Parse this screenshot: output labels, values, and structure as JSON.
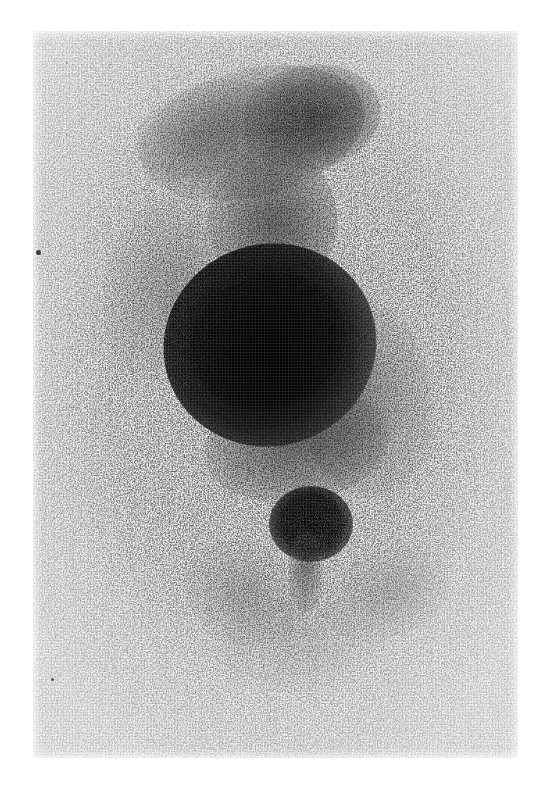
{
  "document": {
    "kind": "nuclear-medicine-scintigram",
    "modality_label": "Gamma camera scintigraphy",
    "view_label": "Anterior whole-body / abdominal view",
    "caption": "",
    "title": ""
  },
  "canvas": {
    "width_px": 546,
    "height_px": 793,
    "page_background_hex": "#ffffff"
  },
  "film_plate": {
    "left_px": 33,
    "top_px": 31,
    "width_px": 485,
    "height_px": 727,
    "background_hex": "#f7f7f6",
    "grain_hex": "#96969b",
    "description": "Grey-white photographic scan film with fine crosshatch weave texture"
  },
  "activity_map": {
    "colormap": "greyscale-inverted",
    "max_density_hex": "#111111",
    "mid_density_hex": "#6b6b6b",
    "low_density_hex": "#c9c9c9",
    "background_density_hex": "#f5f5f4",
    "regions": [
      {
        "name": "upper-diffuse-uptake",
        "anatomy_label": "head / upper thorax diffuse activity",
        "intensity": "low-moderate",
        "center_x_px": 245,
        "center_y_px": 125,
        "radius_x_px": 110,
        "radius_y_px": 58,
        "rotation_deg": -14,
        "peak_opacity": 0.46
      },
      {
        "name": "upper-right-shoulder-uptake",
        "anatomy_label": "right shoulder / upper mediastinum",
        "intensity": "moderate",
        "center_x_px": 305,
        "center_y_px": 118,
        "radius_x_px": 62,
        "radius_y_px": 45,
        "rotation_deg": -10,
        "peak_opacity": 0.62
      },
      {
        "name": "mediastinal-column",
        "anatomy_label": "mediastinal / spinal column activity",
        "intensity": "moderate",
        "center_x_px": 268,
        "center_y_px": 212,
        "radius_x_px": 58,
        "radius_y_px": 66,
        "rotation_deg": 0,
        "peak_opacity": 0.58
      },
      {
        "name": "dominant-hot-mass",
        "anatomy_label": "liver — dominant intense uptake",
        "intensity": "maximum",
        "center_x_px": 265,
        "center_y_px": 340,
        "radius_x_px": 102,
        "radius_y_px": 96,
        "rotation_deg": -18,
        "peak_opacity": 0.99
      },
      {
        "name": "left-lateral-halo",
        "anatomy_label": "left lateral soft-tissue background",
        "intensity": "low",
        "center_x_px": 162,
        "center_y_px": 280,
        "radius_x_px": 58,
        "radius_y_px": 88,
        "rotation_deg": 12,
        "peak_opacity": 0.34
      },
      {
        "name": "right-lateral-halo",
        "anatomy_label": "right lateral soft-tissue background",
        "intensity": "low-moderate",
        "center_x_px": 360,
        "center_y_px": 395,
        "radius_x_px": 62,
        "radius_y_px": 96,
        "rotation_deg": -6,
        "peak_opacity": 0.4
      },
      {
        "name": "sub-hepatic-band",
        "anatomy_label": "sub-hepatic / bowel activity band",
        "intensity": "moderate",
        "center_x_px": 292,
        "center_y_px": 440,
        "radius_x_px": 88,
        "radius_y_px": 52,
        "rotation_deg": -8,
        "peak_opacity": 0.5
      },
      {
        "name": "focal-hot-spot",
        "anatomy_label": "focal round hot spot — bladder / renal pelvis",
        "intensity": "maximum",
        "center_x_px": 304,
        "center_y_px": 521,
        "radius_x_px": 36,
        "radius_y_px": 32,
        "rotation_deg": 0,
        "peak_opacity": 0.97
      },
      {
        "name": "hot-spot-tail",
        "anatomy_label": "inferior drainage tract below hot spot",
        "intensity": "low-moderate",
        "center_x_px": 304,
        "center_y_px": 566,
        "radius_x_px": 12,
        "radius_y_px": 32,
        "rotation_deg": 0,
        "peak_opacity": 0.44
      },
      {
        "name": "pelvic-left-spill",
        "anatomy_label": "left pelvic / upper thigh scatter",
        "intensity": "low",
        "center_x_px": 240,
        "center_y_px": 590,
        "radius_x_px": 58,
        "radius_y_px": 48,
        "rotation_deg": 20,
        "peak_opacity": 0.28
      },
      {
        "name": "pelvic-right-spill",
        "anatomy_label": "right pelvic / upper thigh scatter",
        "intensity": "low",
        "center_x_px": 382,
        "center_y_px": 580,
        "radius_x_px": 60,
        "radius_y_px": 42,
        "rotation_deg": -22,
        "peak_opacity": 0.26
      },
      {
        "name": "inferior-faint-trail",
        "anatomy_label": "faint inferior background counts",
        "intensity": "very-low",
        "center_x_px": 290,
        "center_y_px": 640,
        "radius_x_px": 72,
        "radius_y_px": 44,
        "rotation_deg": 0,
        "peak_opacity": 0.16
      }
    ]
  },
  "artifacts": [
    {
      "name": "film-dust-dot-left",
      "x_px": 38,
      "y_px": 252,
      "size_px": 5
    },
    {
      "name": "film-dust-dot-lower-left",
      "x_px": 52,
      "y_px": 679,
      "size_px": 3
    },
    {
      "name": "film-dust-dot-upper-left",
      "x_px": 67,
      "y_px": 63,
      "size_px": 2
    }
  ],
  "annotations": {
    "markers": [],
    "text_overlays": [],
    "scale_bar": null,
    "patient_identifiers": []
  }
}
